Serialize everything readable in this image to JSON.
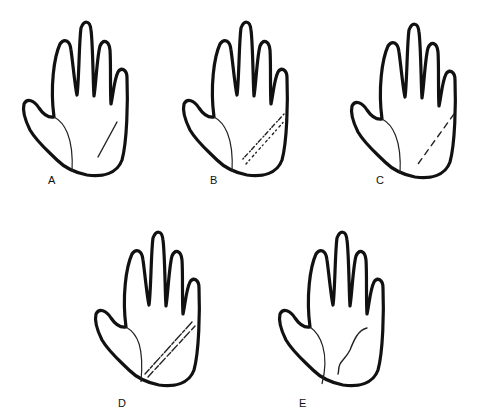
{
  "figure": {
    "panels": [
      {
        "id": "A",
        "label": "A",
        "line_style": "solid",
        "x": 20,
        "y": 15
      },
      {
        "id": "B",
        "label": "B",
        "line_style": "double-dotted",
        "x": 185,
        "y": 15
      },
      {
        "id": "C",
        "label": "C",
        "line_style": "dashed",
        "x": 355,
        "y": 15
      },
      {
        "id": "D",
        "label": "D",
        "line_style": "double-broken",
        "x": 95,
        "y": 225
      },
      {
        "id": "E",
        "label": "E",
        "line_style": "wavy",
        "x": 275,
        "y": 225
      }
    ],
    "colors": {
      "ink": "#111111",
      "background": "#ffffff"
    }
  }
}
